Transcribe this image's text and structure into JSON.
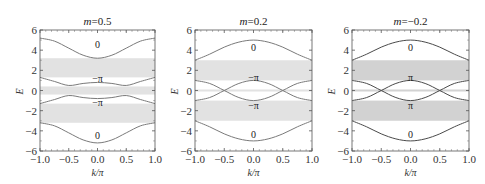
{
  "chart_data": [
    {
      "type": "line",
      "title": "m=0.5",
      "title_var": "m",
      "title_value": "=0.5",
      "xlabel": "k/π",
      "ylabel": "E",
      "xlim": [
        -1.0,
        1.0
      ],
      "ylim": [
        -6,
        6
      ],
      "xticks": [
        "−1.0",
        "−0.5",
        "0.0",
        "0.5",
        "1.0"
      ],
      "yticks": [
        "6",
        "4",
        "2",
        "0",
        "−2",
        "−4",
        "−6"
      ],
      "band_color": "#e2e2e2",
      "line_color": "#7a7a7a",
      "gaps": [
        [
          1.3,
          3.2
        ],
        [
          -0.4,
          0.4
        ],
        [
          -3.2,
          -1.3
        ]
      ],
      "x": [
        -1.0,
        -0.75,
        -0.5,
        -0.25,
        0.0,
        0.25,
        0.5,
        0.75,
        1.0
      ],
      "series": [
        {
          "name": "band1",
          "values": [
            5.2,
            4.9,
            4.2,
            3.5,
            3.2,
            3.5,
            4.2,
            4.9,
            5.2
          ],
          "note": "upper outer band (axis shifted)"
        },
        {
          "name": "band2",
          "values": [
            1.3,
            0.9,
            0.5,
            0.7,
            0.8,
            0.7,
            0.5,
            0.9,
            1.3
          ]
        },
        {
          "name": "band3",
          "values": [
            -1.3,
            -0.9,
            -0.5,
            -0.7,
            -0.8,
            -0.7,
            -0.5,
            -0.9,
            -1.3
          ]
        },
        {
          "name": "band4",
          "values": [
            -3.2,
            -3.5,
            -4.2,
            -4.9,
            -5.2,
            -4.9,
            -4.2,
            -3.5,
            -3.2
          ]
        }
      ],
      "annotations": [
        {
          "text": "0",
          "x": 0.0,
          "y": 4.6
        },
        {
          "text": "−π",
          "x": 0.0,
          "y": 1.2
        },
        {
          "text": "−π",
          "x": 0.0,
          "y": -1.2
        },
        {
          "text": "0",
          "x": 0.0,
          "y": -4.5
        }
      ]
    },
    {
      "type": "line",
      "title": "m=0.2",
      "title_var": "m",
      "title_value": "=0.2",
      "xlabel": "k/π",
      "ylabel": "E",
      "xlim": [
        -1.0,
        1.0
      ],
      "ylim": [
        -6,
        6
      ],
      "xticks": [
        "−1.0",
        "−0.5",
        "0.0",
        "0.5",
        "1.0"
      ],
      "yticks": [
        "6",
        "4",
        "2",
        "0",
        "−2",
        "−4",
        "−6"
      ],
      "band_color": "#e2e2e2",
      "line_color": "#7a7a7a",
      "gaps": [
        [
          1.0,
          3.0
        ],
        [
          -0.1,
          0.1
        ],
        [
          -3.0,
          -1.0
        ]
      ],
      "x": [
        -1.0,
        -0.75,
        -0.5,
        -0.25,
        0.0,
        0.25,
        0.5,
        0.75,
        1.0
      ],
      "series": [
        {
          "name": "band1",
          "values": [
            3.0,
            3.6,
            4.3,
            4.8,
            5.0,
            4.8,
            4.3,
            3.6,
            3.0
          ]
        },
        {
          "name": "band2",
          "values": [
            1.0,
            0.7,
            0.0,
            -0.7,
            -1.0,
            -0.7,
            0.0,
            0.7,
            1.0
          ]
        },
        {
          "name": "band3",
          "values": [
            -1.0,
            -0.7,
            0.0,
            0.7,
            1.0,
            0.7,
            0.0,
            -0.7,
            -1.0
          ]
        },
        {
          "name": "band4",
          "values": [
            -3.0,
            -3.6,
            -4.3,
            -4.8,
            -5.0,
            -4.8,
            -4.3,
            -3.6,
            -3.0
          ]
        }
      ],
      "annotations": [
        {
          "text": "0",
          "x": 0.0,
          "y": 4.3
        },
        {
          "text": "−π",
          "x": 0.0,
          "y": 1.3
        },
        {
          "text": "−π",
          "x": 0.0,
          "y": -1.5
        },
        {
          "text": "0",
          "x": 0.0,
          "y": -4.4
        }
      ]
    },
    {
      "type": "line",
      "title": "m=−0.2",
      "title_var": "m",
      "title_value": "=−0.2",
      "xlabel": "k/π",
      "ylabel": "E",
      "xlim": [
        -1.0,
        1.0
      ],
      "ylim": [
        -6,
        6
      ],
      "xticks": [
        "−1.0",
        "−0.5",
        "0.0",
        "0.5",
        "1.0"
      ],
      "yticks": [
        "6",
        "4",
        "2",
        "0",
        "−2",
        "−4",
        "−6"
      ],
      "band_color": "#d2d2d2",
      "line_color": "#4a4a4a",
      "gaps": [
        [
          1.0,
          3.0
        ],
        [
          -0.1,
          0.1
        ],
        [
          -3.0,
          -1.0
        ]
      ],
      "x": [
        -1.0,
        -0.75,
        -0.5,
        -0.25,
        0.0,
        0.25,
        0.5,
        0.75,
        1.0
      ],
      "series": [
        {
          "name": "band1",
          "values": [
            3.0,
            3.6,
            4.3,
            4.8,
            5.0,
            4.8,
            4.3,
            3.6,
            3.0
          ]
        },
        {
          "name": "band2",
          "values": [
            1.0,
            0.7,
            0.0,
            -0.7,
            -1.0,
            -0.7,
            0.0,
            0.7,
            1.0
          ]
        },
        {
          "name": "band3",
          "values": [
            -1.0,
            -0.7,
            0.0,
            0.7,
            1.0,
            0.7,
            0.0,
            -0.7,
            -1.0
          ]
        },
        {
          "name": "band4",
          "values": [
            -3.0,
            -3.6,
            -4.3,
            -4.8,
            -5.0,
            -4.8,
            -4.3,
            -3.6,
            -3.0
          ]
        }
      ],
      "annotations": [
        {
          "text": "0",
          "x": 0.0,
          "y": 4.3
        },
        {
          "text": "π",
          "x": 0.0,
          "y": 1.3
        },
        {
          "text": "π",
          "x": 0.0,
          "y": -1.5
        },
        {
          "text": "0",
          "x": 0.0,
          "y": -4.4
        }
      ]
    }
  ],
  "layout": {
    "panels": [
      {
        "left": 40,
        "right": 155,
        "top": 30,
        "bottom": 151
      },
      {
        "left": 195,
        "right": 312,
        "top": 30,
        "bottom": 151
      },
      {
        "left": 352,
        "right": 469,
        "top": 30,
        "bottom": 151
      }
    ]
  }
}
